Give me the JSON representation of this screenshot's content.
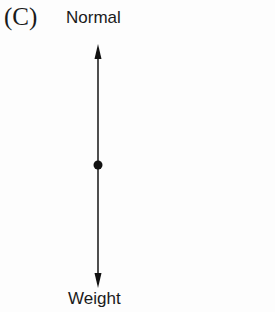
{
  "figure": {
    "panel_label": "(C)",
    "top_label": "Normal",
    "bottom_label": "Weight"
  },
  "diagram": {
    "type": "free-body-diagram",
    "object": "point mass (dot)",
    "forces": [
      {
        "name": "Normal",
        "direction": "up"
      },
      {
        "name": "Weight",
        "direction": "down"
      }
    ],
    "relative_magnitudes": "equal",
    "line_color": "#222222",
    "dot_color": "#111111"
  }
}
